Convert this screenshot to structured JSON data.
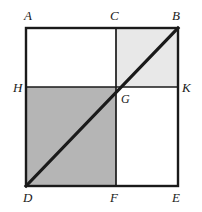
{
  "figure": {
    "canvas": {
      "width": 202,
      "height": 212,
      "background": "#ffffff"
    },
    "square": {
      "left": 26,
      "top": 28,
      "right": 178,
      "bottom": 186,
      "stroke_color": "#1a1a1a",
      "stroke_width": 2.4
    },
    "midlines": {
      "vertical_x": 116,
      "horizontal_y": 87,
      "stroke_color": "#1a1a1a",
      "stroke_width": 1.6
    },
    "diagonal": {
      "from": "D",
      "to": "B",
      "x1": 26,
      "y1": 186,
      "x2": 178,
      "y2": 28,
      "stroke_color": "#1a1a1a",
      "stroke_width": 3.2
    },
    "quadrants": [
      {
        "name": "top-left",
        "fill": "#ffffff",
        "label": "A-C-G-H"
      },
      {
        "name": "top-right",
        "fill": "#e8e8e8",
        "label": "C-B-K-G"
      },
      {
        "name": "bottom-left",
        "fill": "#b5b5b5",
        "label": "H-G-F-D"
      },
      {
        "name": "bottom-right",
        "fill": "#ffffff",
        "label": "G-K-E-F"
      }
    ],
    "colors": {
      "light_shade": "#e8e8e8",
      "dark_shade": "#b5b5b5",
      "white": "#ffffff",
      "ink": "#1a1a1a"
    },
    "points": {
      "A": {
        "label": "A",
        "x": 26,
        "y": 28
      },
      "C": {
        "label": "C",
        "x": 116,
        "y": 28
      },
      "B": {
        "label": "B",
        "x": 178,
        "y": 28
      },
      "H": {
        "label": "H",
        "x": 26,
        "y": 87
      },
      "G": {
        "label": "G",
        "x": 116,
        "y": 87
      },
      "K": {
        "label": "K",
        "x": 178,
        "y": 87
      },
      "D": {
        "label": "D",
        "x": 26,
        "y": 186
      },
      "F": {
        "label": "F",
        "x": 116,
        "y": 186
      },
      "E": {
        "label": "E",
        "x": 178,
        "y": 186
      }
    }
  }
}
